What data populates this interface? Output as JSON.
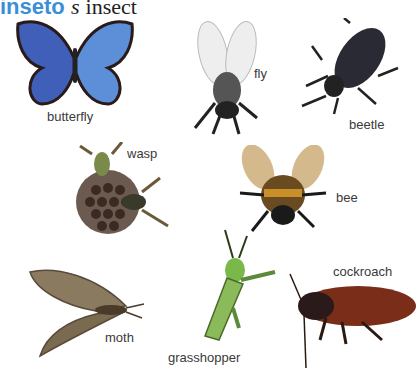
{
  "entry": {
    "headword": "inseto",
    "part_of_speech": "s",
    "translation": "insect"
  },
  "illustrations": [
    {
      "label": "butterfly"
    },
    {
      "label": "fly"
    },
    {
      "label": "beetle"
    },
    {
      "label": "wasp"
    },
    {
      "label": "bee"
    },
    {
      "label": "moth"
    },
    {
      "label": "grasshopper"
    },
    {
      "label": "cockroach"
    }
  ]
}
